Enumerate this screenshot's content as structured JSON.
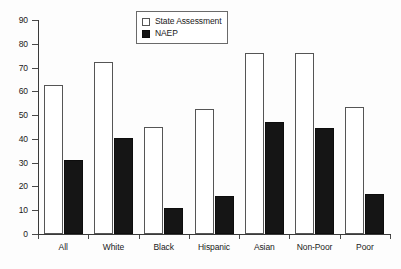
{
  "chart_data": {
    "type": "bar",
    "title": "",
    "subtitle": "",
    "xlabel": "",
    "ylabel": "",
    "ylim": [
      0,
      90
    ],
    "ytick_labels": [
      "0",
      "10",
      "20",
      "30",
      "40",
      "50",
      "60",
      "70",
      "80",
      "90"
    ],
    "ytick_values": [
      0,
      10,
      20,
      30,
      40,
      50,
      60,
      70,
      80,
      90
    ],
    "grid": false,
    "legend_position": "top-center",
    "categories": [
      "All",
      "White",
      "Black",
      "Hispanic",
      "Asian",
      "Non-Poor",
      "Poor"
    ],
    "series": [
      {
        "name": "State Assessment",
        "color": "#ffffff",
        "edge_color": "#555555",
        "values": [
          62.5,
          72.5,
          45.0,
          52.5,
          76.0,
          76.0,
          53.5
        ]
      },
      {
        "name": "NAEP",
        "color": "#141414",
        "edge_color": "#0d0d0d",
        "values": [
          31.0,
          40.5,
          11.0,
          16.0,
          47.0,
          44.5,
          17.0
        ]
      }
    ]
  },
  "legend": {
    "items": [
      {
        "label": "State Assessment",
        "swatch": "open-square-white"
      },
      {
        "label": "NAEP",
        "swatch": "filled-square-black"
      }
    ]
  }
}
